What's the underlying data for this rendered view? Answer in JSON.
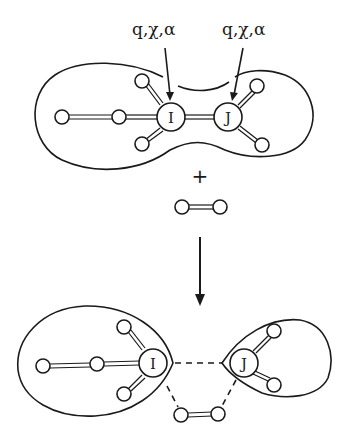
{
  "diagram": {
    "top": {
      "label_I": "q,χ,α",
      "label_J": "q,χ,α",
      "atom_I": "I",
      "atom_J": "J"
    },
    "operator": "+",
    "bottom": {
      "atom_I": "I",
      "atom_J": "J"
    },
    "colors": {
      "ink": "#1a1a1a",
      "background": "#ffffff"
    }
  }
}
